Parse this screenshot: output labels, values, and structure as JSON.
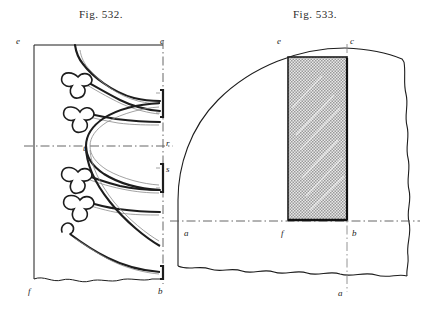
{
  "page": {
    "background_color": "#ffffff",
    "ink_color": "#1d1d1d"
  },
  "figures": [
    {
      "id": "fig-532",
      "title": "Fig. 532.",
      "type": "elevation-tracery",
      "labels": [
        {
          "key": "e",
          "text": "e",
          "corner": "top-left",
          "x": 16,
          "y": 36
        },
        {
          "key": "c",
          "text": "c",
          "corner": "top-right",
          "x": 160,
          "y": 36
        },
        {
          "key": "t",
          "text": "t",
          "corner": "center-inner",
          "x": 83,
          "y": 143
        },
        {
          "key": "r",
          "text": "r",
          "corner": "mid-right",
          "x": 160,
          "y": 142
        },
        {
          "key": "s",
          "text": "s",
          "corner": "lower-right",
          "x": 160,
          "y": 168
        },
        {
          "key": "f",
          "text": "f",
          "corner": "bottom-left",
          "x": 28,
          "y": 286
        },
        {
          "key": "b",
          "text": "b",
          "corner": "bottom-right",
          "x": 158,
          "y": 286
        }
      ]
    },
    {
      "id": "fig-533",
      "title": "Fig. 533.",
      "type": "plan-section",
      "labels": [
        {
          "key": "e",
          "text": "e",
          "corner": "top-left-arc",
          "x": 277,
          "y": 36
        },
        {
          "key": "c",
          "text": "c",
          "corner": "top-right-arc",
          "x": 350,
          "y": 36
        },
        {
          "key": "a",
          "text": "a",
          "corner": "mid-left",
          "x": 184,
          "y": 231
        },
        {
          "key": "f",
          "text": "f",
          "corner": "mid-center",
          "x": 281,
          "y": 231
        },
        {
          "key": "b",
          "text": "b",
          "corner": "mid-right",
          "x": 350,
          "y": 231
        },
        {
          "key": "a",
          "text": "a",
          "corner": "bottom-center",
          "x": 338,
          "y": 290
        }
      ]
    }
  ]
}
